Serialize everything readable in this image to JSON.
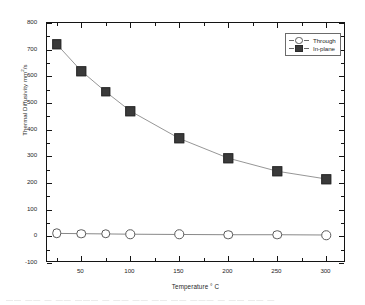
{
  "figure": {
    "background_color": "#ffffff",
    "frame_color": "#141414",
    "bottom_artifact_text": "——  ——  — ——  ———  — ——  ——  —— ——  ———  — —— —— —"
  },
  "chart_data": {
    "type": "line",
    "title": "",
    "xlabel": "Temperature ° C",
    "ylabel_prefix": "Thermal Diffusivity mm",
    "ylabel_sup": "2",
    "ylabel_suffix": "/s",
    "ylabel_plain": "Thermal Diffusivity mm2/s",
    "xlim": [
      15,
      320
    ],
    "ylim": [
      -100,
      800
    ],
    "xticks": [
      50,
      100,
      150,
      200,
      250,
      300
    ],
    "xtick_labels": [
      "50",
      "100",
      "150",
      "200",
      "250",
      "300"
    ],
    "yticks": [
      -100,
      0,
      100,
      200,
      300,
      400,
      500,
      600,
      700,
      800
    ],
    "ytick_labels": [
      "-100",
      "0",
      "100",
      "200",
      "300",
      "400",
      "500",
      "600",
      "700",
      "800"
    ],
    "x_minor_per_major": 1,
    "y_minor_per_major": 1,
    "grid": false,
    "legend_position": "top-right",
    "x": [
      25,
      50,
      75,
      100,
      150,
      200,
      250,
      300
    ],
    "series": [
      {
        "name": "Through",
        "marker": "open-circle",
        "marker_color": "#ffffff",
        "marker_edge_color": "#5a5a5a",
        "line_color": "#6a6a6a",
        "values": [
          11,
          10,
          9,
          8,
          7,
          6,
          6,
          5
        ]
      },
      {
        "name": "In-plane",
        "marker": "filled-square",
        "marker_color": "#3a3a3a",
        "marker_edge_color": "#2b2b2b",
        "line_color": "#8a8a8a",
        "values": [
          720,
          620,
          542,
          470,
          367,
          293,
          244,
          215
        ]
      }
    ]
  }
}
